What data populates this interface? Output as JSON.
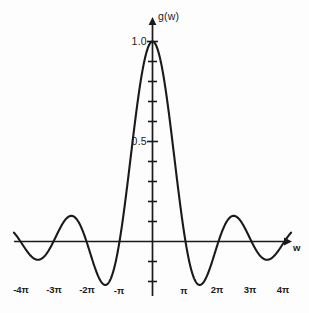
{
  "figure": {
    "background_color": "#fdfdfd",
    "ink_color": "#1a1a1a"
  },
  "axes": {
    "y_axis_label": "g(w)",
    "x_axis_label": "w",
    "y_tick_labels": [
      "1.0",
      "0.5"
    ],
    "x_tick_labels": [
      "-4π",
      "-3π",
      "-2π",
      "-π",
      "π",
      "2π",
      "3π",
      "4π"
    ]
  },
  "chart_data": {
    "type": "line",
    "title": "",
    "xlabel": "w",
    "ylabel": "g(w)",
    "xlim": [
      -4.2,
      4.2
    ],
    "ylim": [
      -0.25,
      1.08
    ],
    "grid": false,
    "legend": null,
    "x_unit": "pi",
    "x_tick_values": [
      -4,
      -3,
      -2,
      -1,
      1,
      2,
      3,
      4
    ],
    "x_tick_labels": [
      "-4π",
      "-3π",
      "-2π",
      "-π",
      "π",
      "2π",
      "3π",
      "4π"
    ],
    "y_tick_values": [
      1.0,
      0.5
    ],
    "y_tick_labels": [
      "1.0",
      "0.5"
    ],
    "y_minor_tick_step": 0.1,
    "function": "sinc: g(w) = sin(w)/w",
    "series": [
      {
        "name": "g(w) = sin(w)/w",
        "x": [
          -4.2,
          -4.0,
          -3.8,
          -3.6,
          -3.5,
          -3.4,
          -3.2,
          -3.0,
          -2.8,
          -2.6,
          -2.5,
          -2.4,
          -2.2,
          -2.0,
          -1.8,
          -1.6,
          -1.5,
          -1.4,
          -1.2,
          -1.0,
          -0.8,
          -0.6,
          -0.4,
          -0.2,
          0.0,
          0.2,
          0.4,
          0.6,
          0.8,
          1.0,
          1.2,
          1.4,
          1.5,
          1.6,
          1.8,
          2.0,
          2.2,
          2.4,
          2.5,
          2.6,
          2.8,
          3.0,
          3.2,
          3.4,
          3.5,
          3.6,
          3.8,
          4.0,
          4.2
        ],
        "y": [
          -0.0466,
          0.0,
          0.0424,
          0.0718,
          0.0794,
          0.0828,
          0.075,
          0.0,
          -0.0773,
          -0.1199,
          -0.1273,
          -0.1251,
          -0.087,
          0.0,
          0.109,
          0.189,
          0.2122,
          0.2162,
          0.1514,
          0.0,
          -0.204,
          -0.4359,
          -0.6613,
          -0.8504,
          1.0,
          -0.8504,
          -0.6613,
          -0.4359,
          -0.204,
          0.0,
          0.1514,
          0.2162,
          0.2122,
          0.189,
          0.109,
          0.0,
          -0.087,
          -0.1251,
          -0.1273,
          -0.1199,
          -0.0773,
          0.0,
          0.075,
          0.0828,
          0.0794,
          0.0718,
          0.0424,
          0.0,
          -0.0466
        ],
        "notes": "Normalized sinc sin(pi x)/(pi x) in units of pi; peak value 1.0 at w=0, zeros at every integer multiple of pi"
      }
    ],
    "key_points": [
      {
        "label": "main peak",
        "x": 0,
        "y": 1.0
      },
      {
        "label": "first zero",
        "x": 1,
        "y": 0
      },
      {
        "label": "first minimum",
        "x": 1.43,
        "y": -0.217
      },
      {
        "label": "second peak",
        "x": 2.46,
        "y": 0.128
      },
      {
        "label": "second minimum",
        "x": 3.47,
        "y": -0.091
      }
    ]
  }
}
